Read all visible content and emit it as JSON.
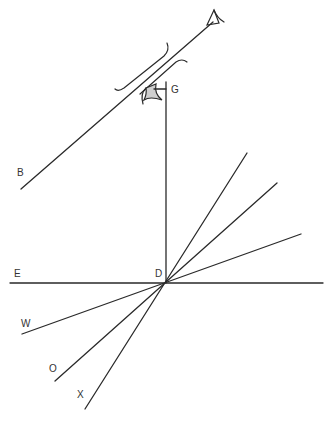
{
  "diagram": {
    "type": "geometric-construction",
    "point_labels": {
      "B": "B",
      "G": "G",
      "E": "E",
      "D": "D",
      "W": "W",
      "O": "O",
      "X": "X"
    },
    "colors": {
      "line": "#2a2a2a",
      "label": "#333333",
      "sight_fill": "#cfcfcf",
      "background": "#ffffff"
    }
  }
}
